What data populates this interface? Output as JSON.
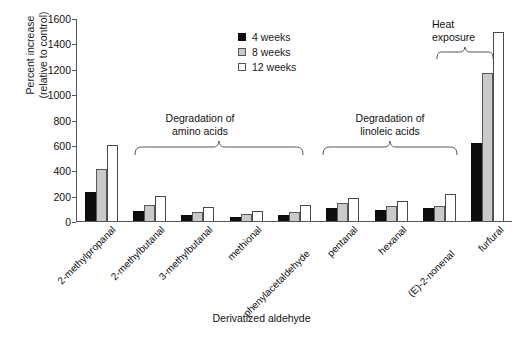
{
  "chart_data": {
    "type": "bar",
    "title": "",
    "xlabel": "Derivatized aldehyde",
    "ylabel_line1": "Percent increase",
    "ylabel_line2": "(relative to control)",
    "ylim": [
      0,
      1600
    ],
    "ytick_step": 200,
    "yticks": [
      "1600",
      "1400",
      "1200",
      "1000",
      "800",
      "600",
      "400",
      "200",
      "0"
    ],
    "ytick_values": [
      1600,
      1400,
      1200,
      1000,
      800,
      600,
      400,
      200,
      0
    ],
    "grid": false,
    "legend_position": "upper-center",
    "categories": [
      "2-methylpropanal",
      "2-methylbutanal",
      "3-methylbutanal",
      "methional",
      "phenylacetaldehyde",
      "pentanal",
      "hexanal",
      "(E)-2-nonenal",
      "furfural"
    ],
    "series": [
      {
        "name": "4 weeks",
        "color": "#0d0d0d",
        "values": [
          230,
          80,
          45,
          35,
          45,
          105,
          85,
          105,
          620
        ]
      },
      {
        "name": "8 weeks",
        "color": "#c9c9c9",
        "values": [
          410,
          130,
          70,
          55,
          75,
          140,
          115,
          120,
          1170
        ]
      },
      {
        "name": "12 weeks",
        "color": "#ffffff",
        "values": [
          600,
          200,
          110,
          80,
          125,
          185,
          160,
          215,
          1500
        ]
      }
    ],
    "annotations": [
      {
        "id": "amino",
        "line1": "Degradation of",
        "line2": "amino acids",
        "spans": [
          "2-methylpropanal",
          "phenylacetaldehyde"
        ]
      },
      {
        "id": "linoleic",
        "line1": "Degradation of",
        "line2": "linoleic acids",
        "spans": [
          "pentanal",
          "(E)-2-nonenal"
        ]
      },
      {
        "id": "heat",
        "line1": "Heat",
        "line2": "exposure",
        "spans": [
          "furfural"
        ]
      }
    ]
  },
  "legend": {
    "items": [
      {
        "label": "4 weeks"
      },
      {
        "label": "8 weeks"
      },
      {
        "label": "12 weeks"
      }
    ]
  }
}
